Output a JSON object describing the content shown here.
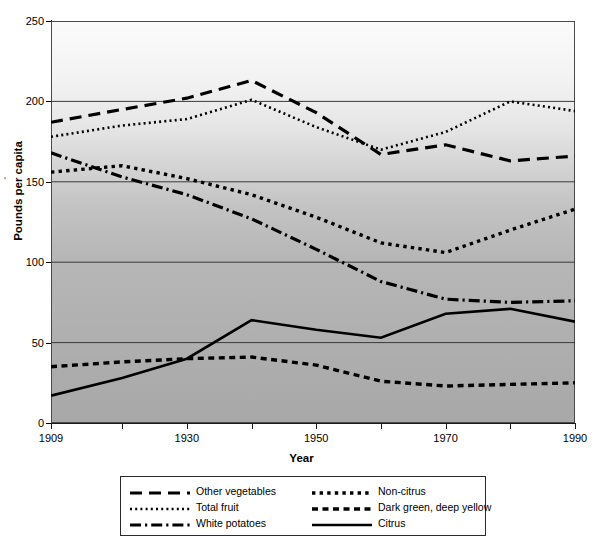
{
  "chart_data": {
    "type": "line",
    "title": "",
    "xlabel": "Year",
    "ylabel": "Pounds per capita",
    "xlim": [
      1909,
      1990
    ],
    "ylim": [
      0,
      250
    ],
    "grid": true,
    "grid_axis": "y",
    "legend_position": "below",
    "x": [
      1909,
      1920,
      1930,
      1940,
      1950,
      1960,
      1970,
      1980,
      1990
    ],
    "xtick_labels": [
      "1909",
      "1930",
      "1950",
      "1970",
      "1990"
    ],
    "xtick_values": [
      1909,
      1930,
      1950,
      1970,
      1990
    ],
    "ytick_labels": [
      "0",
      "50",
      "100",
      "150",
      "200",
      "250"
    ],
    "ytick_values": [
      0,
      50,
      100,
      150,
      200,
      250
    ],
    "series": [
      {
        "name": "Other vegetables",
        "style": "dashed",
        "color": "#000000",
        "values": [
          187,
          195,
          202,
          213,
          193,
          167,
          173,
          163,
          166
        ]
      },
      {
        "name": "Total fruit",
        "style": "dotted",
        "color": "#000000",
        "values": [
          178,
          185,
          189,
          201,
          184,
          170,
          181,
          200,
          194
        ]
      },
      {
        "name": "White potatoes",
        "style": "dashdot",
        "color": "#000000",
        "values": [
          168,
          153,
          142,
          127,
          108,
          88,
          77,
          75,
          76
        ]
      },
      {
        "name": "Non-citrus",
        "style": "dotted-thick",
        "color": "#000000",
        "values": [
          156,
          160,
          152,
          142,
          128,
          112,
          106,
          120,
          133
        ]
      },
      {
        "name": "Dark green, deep yellow",
        "style": "dashed-short",
        "color": "#000000",
        "values": [
          35,
          38,
          40,
          41,
          36,
          26,
          23,
          24,
          25
        ]
      },
      {
        "name": "Citrus",
        "style": "solid",
        "color": "#000000",
        "values": [
          17,
          28,
          40,
          64,
          58,
          53,
          68,
          71,
          63
        ]
      }
    ]
  },
  "axes": {
    "ylabel": "Pounds per capita",
    "xlabel": "Year",
    "stray_mark": "'"
  },
  "legend": {
    "left_column": [
      {
        "label": "Other vegetables",
        "style": "dashed"
      },
      {
        "label": "Total fruit",
        "style": "dotted"
      },
      {
        "label": "White potatoes",
        "style": "dashdot"
      }
    ],
    "right_column": [
      {
        "label": "Non-citrus",
        "style": "dotted-thick"
      },
      {
        "label": "Dark green, deep yellow",
        "style": "dashed-short"
      },
      {
        "label": "Citrus",
        "style": "solid"
      }
    ]
  },
  "caption": ""
}
